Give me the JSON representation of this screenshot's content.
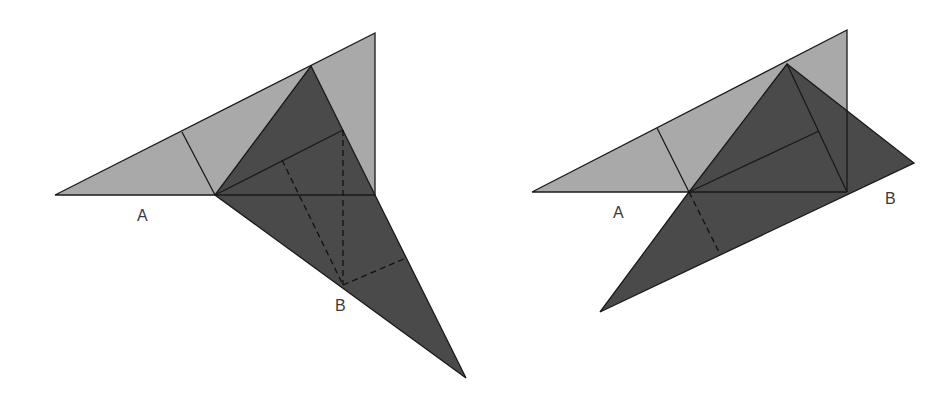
{
  "figure": {
    "colors": {
      "background": "#ffffff",
      "light_fill": "#a9a9a9",
      "dark_fill": "#4a4a4a",
      "stroke": "#1a1a1a",
      "label": "#3a3a3a"
    },
    "panels": [
      {
        "id": "left",
        "labels": [
          {
            "text": "A",
            "x": 143,
            "y": 221
          },
          {
            "text": "B",
            "x": 341,
            "y": 311
          }
        ]
      },
      {
        "id": "right",
        "labels": [
          {
            "text": "A",
            "x": 619,
            "y": 218
          },
          {
            "text": "B",
            "x": 891,
            "y": 204
          }
        ]
      }
    ]
  }
}
